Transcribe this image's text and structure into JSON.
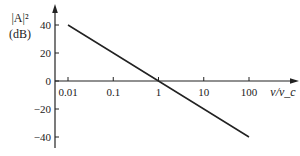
{
  "chart_data": {
    "type": "line",
    "title": "",
    "xlabel": "ν/ν_c",
    "ylabel_line1": "|A|²",
    "ylabel_line2": "(dB)",
    "xscale": "log",
    "x_ticks": [
      0.01,
      0.1,
      1,
      10,
      100
    ],
    "x_tick_labels": [
      "0.01",
      "0.1",
      "1",
      "10",
      "100"
    ],
    "y_ticks": [
      40,
      20,
      0,
      -20,
      -40
    ],
    "y_tick_labels": [
      "40",
      "20",
      "0",
      "-20",
      "-40"
    ],
    "xlim": [
      0.0075,
      300
    ],
    "ylim": [
      -45,
      55
    ],
    "grid": false,
    "legend": null,
    "series": [
      {
        "name": "|A|^2 (dB)",
        "x": [
          0.01,
          0.1,
          1,
          10,
          100
        ],
        "values": [
          40,
          20,
          0,
          -20,
          -40
        ],
        "color": "#222222"
      }
    ],
    "annotations": []
  }
}
